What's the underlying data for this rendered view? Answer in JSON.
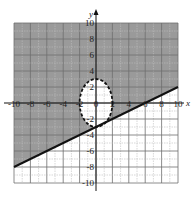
{
  "chart_data": {
    "type": "inequality-region",
    "title": "",
    "xlabel": "x",
    "ylabel": "y",
    "xlim": [
      -10,
      10
    ],
    "ylim": [
      -10,
      10
    ],
    "grid": true,
    "x_ticks": [
      -10,
      -8,
      -6,
      -4,
      -2,
      0,
      2,
      4,
      6,
      8,
      10
    ],
    "y_ticks": [
      -10,
      -8,
      -6,
      -4,
      -2,
      2,
      4,
      6,
      8,
      10
    ],
    "x_tick_labels": [
      "-10",
      "-8",
      "-6",
      "-4",
      "-2",
      "0",
      "2",
      "4",
      "6",
      "8",
      "10"
    ],
    "y_tick_labels": [
      "-10",
      "-8",
      "-6",
      "-4",
      "-2",
      "2",
      "4",
      "6",
      "8",
      "10"
    ],
    "curves": [
      {
        "name": "line",
        "equation": "y = x/2 - 3",
        "style": "solid",
        "points": [
          [
            -10,
            -8
          ],
          [
            0,
            -3
          ],
          [
            6,
            0
          ],
          [
            10,
            2
          ]
        ]
      },
      {
        "name": "ellipse",
        "equation": "x^2/4 + y^2/9 = 1",
        "style": "dashed",
        "center": [
          0,
          0
        ],
        "rx": 2,
        "ry": 3
      }
    ],
    "shaded_region": "above the line y = x/2 - 3 and outside the ellipse x^2/4 + y^2/9 = 1",
    "colors": {
      "shade": "#9a9a9a",
      "grid_light": "#bdbdbd",
      "grid_dark": "#6e6e6e",
      "curve": "#111111"
    }
  }
}
